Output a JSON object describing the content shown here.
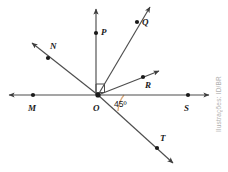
{
  "figure": {
    "origin_label": "O",
    "angle_label": "45º",
    "right_angle_marker": "right-angle-square",
    "colors": {
      "line": "#4d4d4d",
      "label": "#1a1a1a",
      "arc": "#d9a87a",
      "point": "#1a1a1a",
      "background": "#ffffff",
      "credit": "#b0b0b0"
    },
    "points": [
      {
        "label": "M",
        "x": 33,
        "y": 98,
        "label_x": 28,
        "label_y": 107
      },
      {
        "label": "N",
        "x": 48,
        "y": 58,
        "label_x": 50,
        "label_y": 44
      },
      {
        "label": "O",
        "x": 98,
        "y": 95,
        "label_x": 93,
        "label_y": 107
      },
      {
        "label": "P",
        "x": 96,
        "y": 33,
        "label_x": 101,
        "label_y": 29
      },
      {
        "label": "Q",
        "x": 137,
        "y": 22,
        "label_x": 142,
        "label_y": 20
      },
      {
        "label": "R",
        "x": 143,
        "y": 77,
        "label_x": 145,
        "label_y": 83
      },
      {
        "label": "S",
        "x": 188,
        "y": 98,
        "label_x": 184,
        "label_y": 107
      },
      {
        "label": "T",
        "x": 157,
        "y": 148,
        "label_x": 160,
        "label_y": 136
      }
    ],
    "rays": [
      {
        "name": "ray-OM",
        "through": "M",
        "arrow": "left"
      },
      {
        "name": "ray-ON",
        "through": "N",
        "arrow": "upper-left"
      },
      {
        "name": "ray-OP",
        "through": "P",
        "arrow": "up"
      },
      {
        "name": "ray-OQ",
        "through": "Q",
        "arrow": "upper-right"
      },
      {
        "name": "ray-OR",
        "through": "R",
        "arrow": "right-up"
      },
      {
        "name": "ray-OS",
        "through": "S",
        "arrow": "right"
      },
      {
        "name": "ray-OT",
        "through": "T",
        "arrow": "lower-right"
      }
    ]
  },
  "credit": {
    "text": "Ilustrações: ID/BR"
  }
}
